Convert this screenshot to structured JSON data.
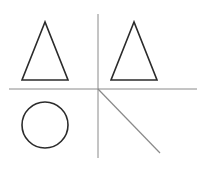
{
  "diagram": {
    "background": "#ffffff",
    "divider_color": "#8a8a8a",
    "shape_color": "#2b2b2b",
    "quadrants": [
      {
        "position": "top-left",
        "shape": "triangle"
      },
      {
        "position": "top-right",
        "shape": "triangle"
      },
      {
        "position": "bottom-left",
        "shape": "circle"
      },
      {
        "position": "bottom-right",
        "shape": "diagonal-line"
      }
    ]
  }
}
